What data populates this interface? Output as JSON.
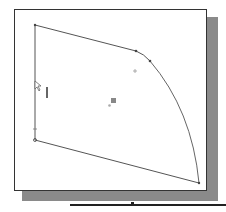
{
  "canvas": {
    "background": "#ffffff",
    "frame_border": "#333333",
    "shadow_color": "#8a8a8a",
    "line_color": "#555555"
  },
  "sketch": {
    "points": {
      "top_left": [
        35,
        25
      ],
      "top_right_tangent_start": [
        136,
        51
      ],
      "arc_start": [
        150,
        61
      ],
      "arc_end": [
        199,
        183
      ],
      "bottom_left": [
        35,
        140
      ]
    },
    "center_marker": [
      113,
      101
    ],
    "cross_marker": [
      135,
      71
    ],
    "cursor_icon": "arrow-cursor-icon",
    "vertical_constraint_icon": "vertical-constraint-icon"
  }
}
